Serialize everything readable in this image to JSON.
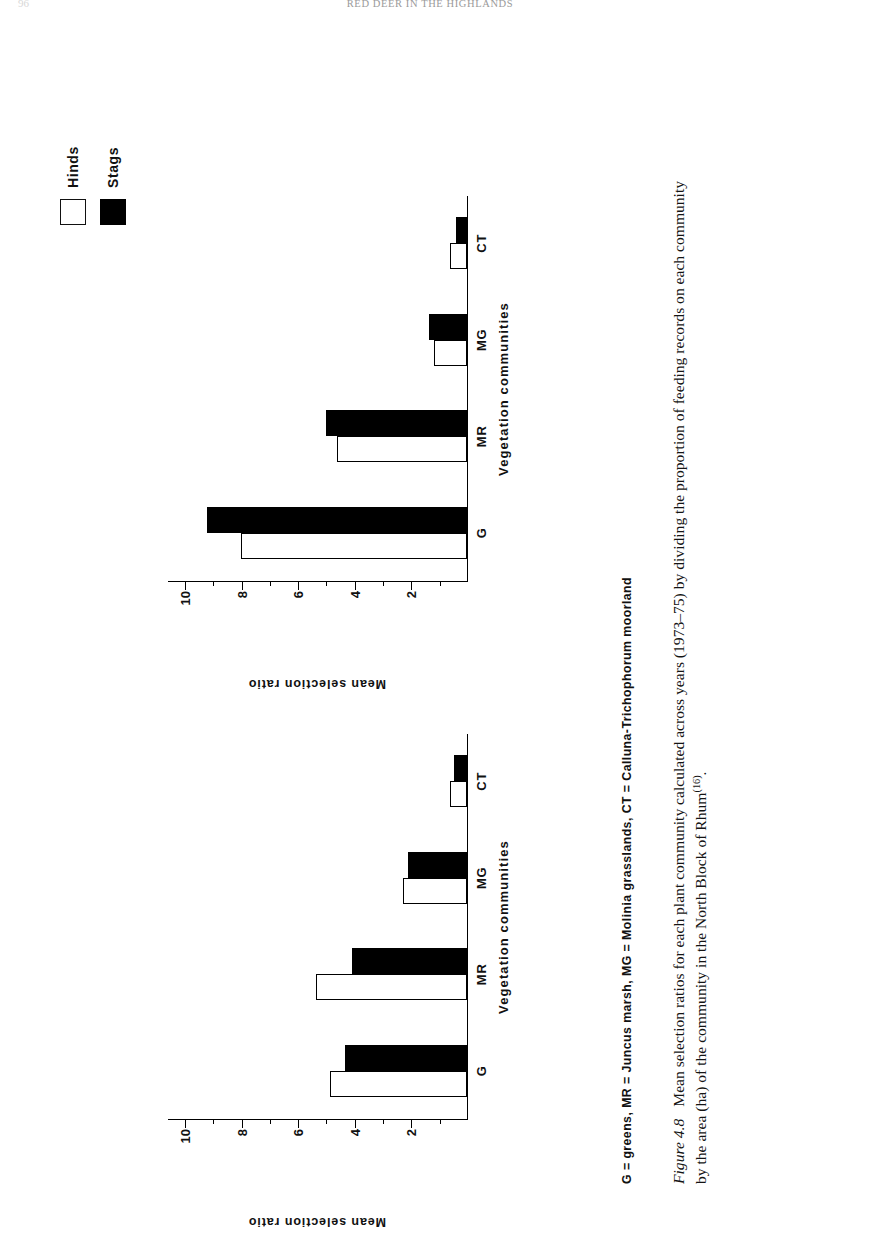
{
  "running_head": {
    "title": "RED DEER IN THE HIGHLANDS",
    "folio": "96"
  },
  "legend": {
    "items": [
      {
        "label": "Hinds",
        "swatch": "open-square",
        "color": "#ffffff"
      },
      {
        "label": "Stags",
        "swatch": "filled-square",
        "color": "#000000"
      }
    ]
  },
  "key_line": {
    "text": "G = greens,  MR = Juncus marsh,  MG = Molinia grasslands,  CT = Calluna-Trichophorum moorland"
  },
  "caption": {
    "figure_number": "Figure 4.8",
    "text": "Mean selection ratios for each plant community calculated across years (1973–75) by dividing the proportion of feeding records on each community by the area (ha) of the community in the North Block of Rhum",
    "reference": "(16)",
    "terminator": "."
  },
  "axes": {
    "y_title": "Mean selection ratio",
    "x_title": "Vegetation communities",
    "y_ticks": [
      "2",
      "4",
      "6",
      "8",
      "10"
    ],
    "y_tick_values": [
      2,
      4,
      6,
      8,
      10
    ],
    "y_minor_values": [
      1,
      3,
      5,
      7,
      9
    ],
    "ylim": [
      0,
      10.6
    ]
  },
  "chart_data": [
    {
      "id": "chart-top",
      "type": "bar",
      "title": "",
      "orientation": "vertical",
      "categories": [
        "G",
        "MR",
        "MG",
        "CT"
      ],
      "series": [
        {
          "name": "Hinds",
          "color": "#ffffff",
          "values": [
            8.0,
            4.6,
            1.15,
            0.6
          ]
        },
        {
          "name": "Stags",
          "color": "#000000",
          "values": [
            9.2,
            5.0,
            1.35,
            0.4
          ]
        }
      ],
      "xlabel": "Vegetation communities",
      "ylabel": "Mean selection ratio",
      "ylim": [
        0,
        10.6
      ],
      "yticks": [
        2,
        4,
        6,
        8,
        10
      ],
      "grid": false,
      "legend_position": "outside-top-right"
    },
    {
      "id": "chart-bottom",
      "type": "bar",
      "title": "",
      "orientation": "vertical",
      "categories": [
        "G",
        "MR",
        "MG",
        "CT"
      ],
      "series": [
        {
          "name": "Hinds",
          "color": "#ffffff",
          "values": [
            4.85,
            5.35,
            2.25,
            0.6
          ]
        },
        {
          "name": "Stags",
          "color": "#000000",
          "values": [
            4.3,
            4.05,
            2.1,
            0.45
          ]
        }
      ],
      "xlabel": "Vegetation communities",
      "ylabel": "Mean selection ratio",
      "ylim": [
        0,
        10.6
      ],
      "yticks": [
        2,
        4,
        6,
        8,
        10
      ],
      "grid": false,
      "legend_position": "outside-top-right"
    }
  ]
}
